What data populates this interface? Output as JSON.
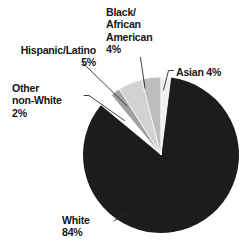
{
  "chart_data": {
    "type": "pie",
    "title": "",
    "subtitle": "",
    "xlabel": "",
    "ylabel": "",
    "legend_position": "none",
    "grid": false,
    "total_percent": 99,
    "units": "%",
    "categories": [
      "White",
      "Asian",
      "Black/African American",
      "Hispanic/Latino",
      "Other non-White"
    ],
    "values": [
      84,
      4,
      4,
      5,
      2
    ],
    "slices": [
      {
        "name": "White",
        "value": 84,
        "label_text": "White\n84%",
        "label_percent": "84%",
        "color": "#1c1c1c",
        "start_angle_deg": 7.2,
        "end_angle_deg": 309.6
      },
      {
        "name": "Asian",
        "value": 4,
        "label_text": "Asian 4%",
        "label_percent": "4%",
        "color": "#f0f0f0",
        "start_angle_deg": 0,
        "end_angle_deg": 7.2
      },
      {
        "name": "Black/African American",
        "value": 4,
        "label_text": "Black/\nAfrican\nAmerican\n4%",
        "label_percent": "4%",
        "color": "#bdbdbd",
        "start_angle_deg": 345.6,
        "end_angle_deg": 360
      },
      {
        "name": "Hispanic/Latino",
        "value": 5,
        "label_text": "Hispanic/Latino\n5%",
        "label_percent": "5%",
        "color": "#d2d2d2",
        "start_angle_deg": 327.6,
        "end_angle_deg": 345.6
      },
      {
        "name": "Other non-White",
        "value": 2,
        "label_text": "Other\nnon-White\n2%",
        "label_percent": "2%",
        "color": "#a0a0a0",
        "start_angle_deg": 320.4,
        "end_angle_deg": 327.6
      }
    ]
  },
  "labels": {
    "black_african_american": "Black/\nAfrican\nAmerican\n4%",
    "hispanic_latino": "Hispanic/Latino\n5%",
    "other_non_white": "Other\nnon-White\n2%",
    "asian": "Asian 4%",
    "white": "White\n84%"
  },
  "colors": {
    "background": "#ffffff",
    "text": "#161616",
    "leader_line": "#2b2b2b",
    "white_slice": "#1c1c1c",
    "asian_slice": "#f0f0f0",
    "black_slice": "#bdbdbd",
    "hispanic_slice": "#d2d2d2",
    "other_slice": "#a0a0a0"
  }
}
